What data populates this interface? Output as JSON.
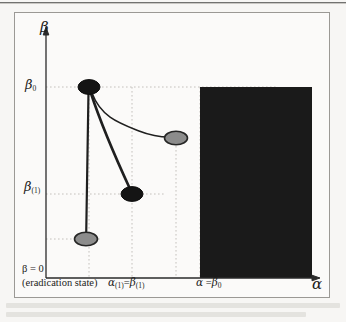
{
  "figure": {
    "axes": {
      "y_axis_label": "β",
      "x_axis_label": "α",
      "y_ticks": [
        {
          "id": "beta0",
          "label": "β",
          "subscript": "0",
          "value_y": 85
        },
        {
          "id": "beta1",
          "label": "β",
          "subscript": "(1)",
          "value_y": 193
        }
      ],
      "origin_label_line1": "β = 0",
      "origin_label_line2": "(eradication state)",
      "x_ticks": [
        {
          "id": "alpha1",
          "label": "α",
          "sub1": "(1)",
          "eq": "=",
          "label2": "β",
          "sub2": "(1)"
        },
        {
          "id": "alpha_beta0",
          "label": "α",
          "eq": "=",
          "label2": "β",
          "sub2": "0"
        }
      ]
    },
    "region": {
      "name": "shaded-region",
      "fill": "#1a1a1a"
    },
    "nodes": [
      {
        "id": "node-beta0-alpha1",
        "fill": "#141414",
        "stroke": "#141414",
        "cx": 88,
        "cy": 86,
        "rx": 11,
        "ry": 7.5
      },
      {
        "id": "node-beta1-alpha1",
        "fill": "#141414",
        "stroke": "#141414",
        "cx": 131,
        "cy": 193,
        "rx": 11,
        "ry": 7.5
      },
      {
        "id": "node-lower-gray",
        "fill": "#8c8c8c",
        "stroke": "#2a2a2a",
        "cx": 85,
        "cy": 238,
        "rx": 11.5,
        "ry": 7
      },
      {
        "id": "node-right-gray",
        "fill": "#8c8c8c",
        "stroke": "#2a2a2a",
        "cx": 175,
        "cy": 137,
        "rx": 11.5,
        "ry": 7
      }
    ],
    "trajectories": [
      {
        "id": "trajectory-vertical",
        "from": "node-beta0-alpha1",
        "to": "node-lower-gray"
      },
      {
        "id": "trajectory-diagonal",
        "from": "node-beta0-alpha1",
        "to": "node-beta1-alpha1"
      },
      {
        "id": "trajectory-curved",
        "from": "node-beta0-alpha1",
        "to": "node-right-gray"
      }
    ],
    "colors": {
      "axis": "#2a2a2a",
      "grid": "#b9b7b2",
      "frame": "#9b9995",
      "page": "#f7f6f4",
      "plot": "#fbfaf9"
    }
  }
}
